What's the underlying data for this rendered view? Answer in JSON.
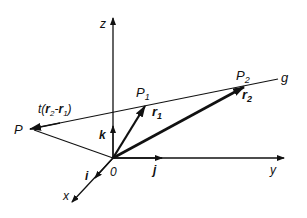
{
  "figure": {
    "type": "vector-diagram",
    "colors": {
      "ink": "#111111",
      "background": "#ffffff"
    }
  },
  "axes": {
    "z": {
      "label": "z",
      "unit_vector": "k"
    },
    "y": {
      "label": "y",
      "unit_vector": "j"
    },
    "x": {
      "label": "x",
      "unit_vector": "i"
    },
    "origin": {
      "label": "0"
    }
  },
  "points": {
    "P": {
      "label": "P"
    },
    "P1": {
      "label": "P",
      "sub": "1"
    },
    "P2": {
      "label": "P",
      "sub": "2"
    }
  },
  "vectors": {
    "r1": {
      "label": "r",
      "sub": "1"
    },
    "r2": {
      "label": "r",
      "sub": "2"
    },
    "t_diff": {
      "prefix": "t(",
      "a": "r",
      "a_sub": "2",
      "minus": "-",
      "b": "r",
      "b_sub": "1",
      "suffix": ")"
    }
  },
  "line": {
    "label": "g"
  }
}
